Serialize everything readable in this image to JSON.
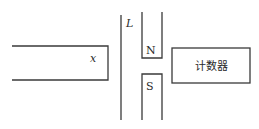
{
  "diagram": {
    "labels": {
      "rod": "x",
      "conductor": "L",
      "north_pole": "N",
      "south_pole": "S",
      "counter": "计数器"
    },
    "colors": {
      "line": "#3a3a3a",
      "text": "#2a2a2a",
      "background": "#ffffff"
    }
  }
}
